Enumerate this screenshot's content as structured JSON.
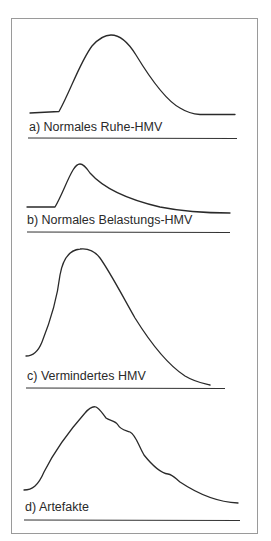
{
  "figure": {
    "panels": [
      {
        "id": "a",
        "label": "a) Normales Ruhe-HMV",
        "description": "Normal resting cardiac output curve: gentle symmetric bell shape"
      },
      {
        "id": "b",
        "label": "b) Normales Belastungs-HMV",
        "description": "Normal exercise cardiac output curve: small, early, sharp peak with long decay"
      },
      {
        "id": "c",
        "label": "c) Vermindertes HMV",
        "description": "Reduced cardiac output curve: tall broad peak with slow decline"
      },
      {
        "id": "d",
        "label": "d) Artefakte",
        "description": "Artifact curve: peak followed by irregular wiggly downslope"
      }
    ]
  }
}
